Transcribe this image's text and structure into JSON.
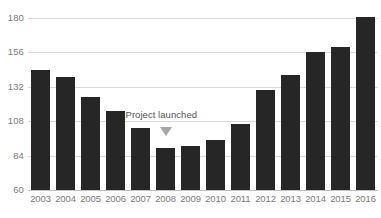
{
  "chart_data": {
    "type": "bar",
    "title": "",
    "xlabel": "",
    "ylabel": "",
    "ylim": [
      60,
      180
    ],
    "yticks": [
      60,
      84,
      108,
      132,
      156,
      180
    ],
    "ytick_labels": [
      "60",
      "84",
      "108",
      "132",
      "156",
      "180"
    ],
    "grid": true,
    "legend": "none",
    "categories": [
      "2003",
      "2004",
      "2005",
      "2006",
      "2007",
      "2008",
      "2009",
      "2010",
      "2011",
      "2012",
      "2013",
      "2014",
      "2015",
      "2016"
    ],
    "values": [
      144,
      139,
      125,
      115,
      103,
      89,
      91,
      95,
      106,
      130,
      140,
      156,
      160,
      181
    ],
    "series": [
      {
        "name": "",
        "values": [
          144,
          139,
          125,
          115,
          103,
          89,
          91,
          95,
          106,
          130,
          140,
          156,
          160,
          181
        ]
      }
    ],
    "annotations": [
      {
        "text": "Project launched",
        "category": "2008",
        "value": 108,
        "marker": "triangle-down"
      }
    ],
    "colors": {
      "bar": "#262626",
      "gridline": "#dadada",
      "baseline": "#c3c3c3",
      "tick_label": "#7a7a7a",
      "annotation_text": "#555555",
      "annotation_marker": "#a6a6a6",
      "background": "#ffffff"
    }
  },
  "chart": {
    "cropped_title": ""
  }
}
